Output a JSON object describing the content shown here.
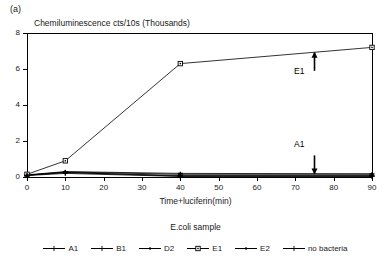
{
  "panel": {
    "label": "(a)"
  },
  "chart_data": {
    "type": "line",
    "title": "Chemiluminescence cts/10s (Thousands)",
    "xlabel": "Time+luciferin(min)",
    "ylabel": "",
    "xlim": [
      0,
      90
    ],
    "ylim": [
      0,
      8
    ],
    "xticks": [
      0,
      10,
      20,
      30,
      40,
      50,
      60,
      70,
      80,
      90
    ],
    "yticks": [
      0,
      2,
      4,
      6,
      8
    ],
    "grid": false,
    "legend_position": "bottom",
    "legend_title": "E.coli sample",
    "series": [
      {
        "name": "A1",
        "marker": "plus",
        "x": [
          0,
          10,
          40,
          90
        ],
        "values": [
          0.1,
          0.25,
          0.05,
          0.05
        ]
      },
      {
        "name": "B1",
        "marker": "plus",
        "x": [
          0,
          10,
          40,
          90
        ],
        "values": [
          0.1,
          0.25,
          0.08,
          0.08
        ]
      },
      {
        "name": "D2",
        "marker": "dash",
        "x": [
          0,
          10,
          40,
          90
        ],
        "values": [
          0.12,
          0.3,
          0.2,
          0.18
        ]
      },
      {
        "name": "E1",
        "marker": "square",
        "x": [
          0,
          10,
          40,
          90
        ],
        "values": [
          0.15,
          0.9,
          6.3,
          7.2
        ]
      },
      {
        "name": "E2",
        "marker": "dash",
        "x": [
          0,
          10,
          40,
          90
        ],
        "values": [
          0.1,
          0.28,
          0.15,
          0.15
        ]
      },
      {
        "name": "no bacteria",
        "marker": "plus",
        "x": [
          0,
          10,
          40,
          90
        ],
        "values": [
          0.08,
          0.2,
          0.03,
          0.03
        ]
      }
    ],
    "annotations": [
      {
        "label": "E1",
        "x": 75,
        "y": 6.9,
        "direction": "up"
      },
      {
        "label": "A1",
        "x": 75,
        "y": 0.2,
        "direction": "down"
      }
    ]
  },
  "ytick_labels": [
    "0",
    "2",
    "4",
    "6",
    "8"
  ],
  "xtick_labels": [
    "0",
    "10",
    "20",
    "30",
    "40",
    "50",
    "60",
    "70",
    "80",
    "90"
  ],
  "legend_items": [
    {
      "label": "A1"
    },
    {
      "label": "B1"
    },
    {
      "label": "D2"
    },
    {
      "label": "E1"
    },
    {
      "label": "E2"
    },
    {
      "label": "no bacteria"
    }
  ],
  "annotation_e1": "E1",
  "annotation_a1": "A1"
}
